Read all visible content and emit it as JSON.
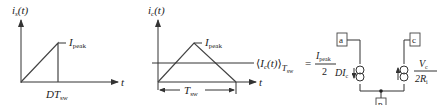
{
  "graph_switch": {
    "y_label": "i",
    "y_label_sub": "s",
    "y_label_arg": "(t)",
    "x_label": "t",
    "peak_label": "I",
    "peak_label_sub": "peak",
    "time_label": "DT",
    "time_label_sub": "sw"
  },
  "graph_capacitor": {
    "y_label": "i",
    "y_label_sub": "c",
    "y_label_arg": "(t)",
    "x_label": "t",
    "peak_label": "I",
    "peak_label_sub": "peak",
    "period_label": "T",
    "period_label_sub": "sw"
  },
  "average_equation": {
    "lhs_open": "⟨",
    "lhs_var": "I",
    "lhs_var_sub": "c",
    "lhs_arg": "(t)",
    "lhs_close": "⟩",
    "lhs_sub": "T",
    "lhs_sub_sub": "sw",
    "equals": "=",
    "numerator": "I",
    "numerator_sub": "peak",
    "denominator": "2"
  },
  "circuit": {
    "terminal_a": "a",
    "terminal_c": "c",
    "terminal_p": "p",
    "left_source_label": "DI",
    "left_source_label_sub": "c",
    "right_source_num": "V",
    "right_source_num_sub": "c",
    "right_source_den": "2R",
    "right_source_den_sub": "i"
  }
}
